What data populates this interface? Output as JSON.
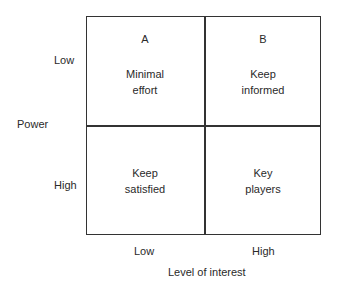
{
  "y_axis": {
    "label": "Power",
    "ticks": [
      "Low",
      "High"
    ]
  },
  "x_axis": {
    "label": "Level of interest",
    "ticks": [
      "Low",
      "High"
    ]
  },
  "quadrants": [
    {
      "letter": "A",
      "line1": "Minimal",
      "line2": "effort"
    },
    {
      "letter": "B",
      "line1": "Keep",
      "line2": "informed"
    },
    {
      "letter": "",
      "line1": "Keep",
      "line2": "satisfied"
    },
    {
      "letter": "",
      "line1": "Key",
      "line2": "players"
    }
  ]
}
